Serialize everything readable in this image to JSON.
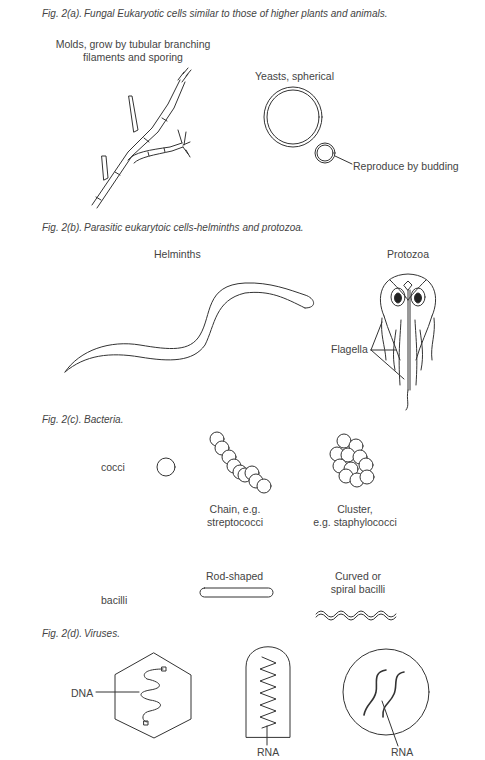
{
  "figures": [
    {
      "id": "2a",
      "number": "Fig. 2(a).",
      "title": "Fungal Eukaryotic cells similar to those of higher plants and animals.",
      "labels": {
        "molds_line1": "Molds, grow by tubular branching",
        "molds_line2": "filaments and sporing",
        "yeasts": "Yeasts, spherical",
        "budding": "Reproduce by budding"
      }
    },
    {
      "id": "2b",
      "number": "Fig. 2(b).",
      "title": "Parasitic eukarytoic cells-helminths and protozoa.",
      "labels": {
        "helminths": "Helminths",
        "protozoa": "Protozoa",
        "flagella": "Flagella"
      }
    },
    {
      "id": "2c",
      "number": "Fig. 2(c).",
      "title": "Bacteria.",
      "labels": {
        "cocci": "cocci",
        "chain_line1": "Chain, e.g.",
        "chain_line2": "streptococci",
        "cluster_line1": "Cluster,",
        "cluster_line2": "e.g. staphylococci",
        "bacilli": "bacilli",
        "rod": "Rod-shaped",
        "curved_line1": "Curved or",
        "curved_line2": "spiral bacilli"
      }
    },
    {
      "id": "2d",
      "number": "Fig. 2(d).",
      "title": "Viruses.",
      "labels": {
        "dna": "DNA",
        "rna1": "RNA",
        "rna2": "RNA"
      }
    }
  ]
}
